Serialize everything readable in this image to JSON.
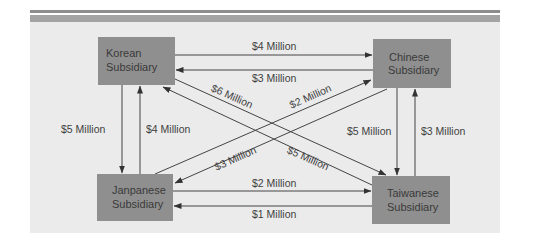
{
  "diagram": {
    "type": "flow-diagram",
    "colors": {
      "panel": "#ebebeb",
      "node": "#8f8f8f",
      "line": "#444444",
      "header_bar_thin": "#8d8d8d",
      "header_bar_thick": "#a3a3a3"
    },
    "nodes": {
      "korean": {
        "line1": "Korean",
        "line2": "Subsidiary"
      },
      "chinese": {
        "line1": "Chinese",
        "line2": "Subsidiary"
      },
      "japanese": {
        "line1": "Janpanese",
        "line2": "Subsidiary"
      },
      "taiwanese": {
        "line1": "Taiwanese",
        "line2": "Subsidiary"
      }
    },
    "flows": [
      {
        "id": "korean_to_chinese",
        "from": "Korean Subsidiary",
        "to": "Chinese Subsidiary",
        "label": "$4 Million"
      },
      {
        "id": "chinese_to_korean",
        "from": "Chinese Subsidiary",
        "to": "Korean Subsidiary",
        "label": "$3 Million"
      },
      {
        "id": "korean_to_japanese",
        "from": "Korean Subsidiary",
        "to": "Janpanese Subsidiary",
        "label": "$5 Million"
      },
      {
        "id": "japanese_to_korean",
        "from": "Janpanese Subsidiary",
        "to": "Korean Subsidiary",
        "label": "$4 Million"
      },
      {
        "id": "chinese_to_taiwanese",
        "from": "Chinese Subsidiary",
        "to": "Taiwanese Subsidiary",
        "label": "$5 Million"
      },
      {
        "id": "taiwanese_to_chinese",
        "from": "Taiwanese Subsidiary",
        "to": "Chinese Subsidiary",
        "label": "$3 Million"
      },
      {
        "id": "japanese_to_taiwanese",
        "from": "Janpanese Subsidiary",
        "to": "Taiwanese Subsidiary",
        "label": "$2 Million"
      },
      {
        "id": "taiwanese_to_japanese",
        "from": "Taiwanese Subsidiary",
        "to": "Janpanese Subsidiary",
        "label": "$1 Million"
      },
      {
        "id": "korean_to_taiwanese",
        "from": "Korean Subsidiary",
        "to": "Taiwanese Subsidiary",
        "label": "$6 Million"
      },
      {
        "id": "taiwanese_to_korean",
        "from": "Taiwanese Subsidiary",
        "to": "Korean Subsidiary",
        "label": "$5 Million"
      },
      {
        "id": "japanese_to_chinese",
        "from": "Janpanese Subsidiary",
        "to": "Chinese Subsidiary",
        "label": "$2 Million"
      },
      {
        "id": "chinese_to_japanese",
        "from": "Chinese Subsidiary",
        "to": "Janpanese Subsidiary",
        "label": "$3 Million"
      }
    ]
  }
}
